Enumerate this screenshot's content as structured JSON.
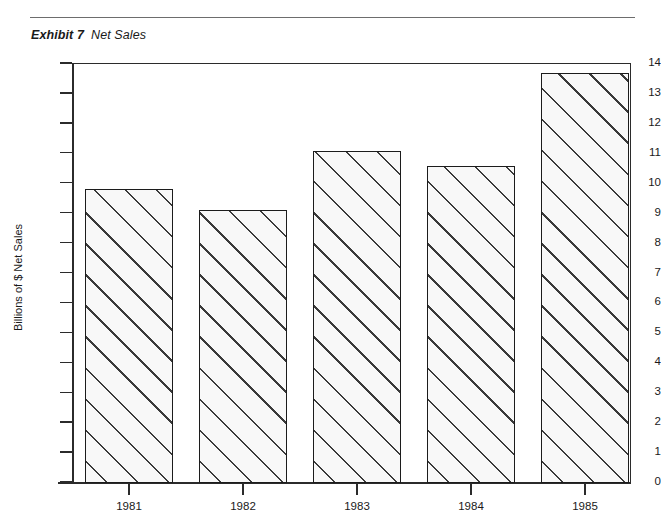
{
  "header": {
    "exhibit_label": "Exhibit 7",
    "exhibit_name": "Net Sales"
  },
  "chart_data": {
    "type": "bar",
    "title": "Net Sales",
    "exhibit": "Exhibit 7",
    "categories": [
      "1981",
      "1982",
      "1983",
      "1984",
      "1985"
    ],
    "values": [
      9.8,
      9.1,
      11.05,
      10.55,
      13.65
    ],
    "xlabel": "",
    "ylabel": "Billions of $ Net Sales",
    "ylim": [
      0,
      14
    ],
    "y_ticks": [
      "14",
      "13",
      "12",
      "11",
      "10",
      "9",
      "8",
      "7",
      "6",
      "5",
      "4",
      "3",
      "2",
      "1",
      "0"
    ],
    "y_tick_values": [
      14,
      13,
      12,
      11,
      10,
      9,
      8,
      7,
      6,
      5,
      4,
      3,
      2,
      1,
      0
    ],
    "grid": false,
    "legend": null,
    "bar_style": {
      "fill": "#f8f8f8",
      "hatch": "diagonal-45",
      "edge": "#1c1c1c"
    }
  }
}
